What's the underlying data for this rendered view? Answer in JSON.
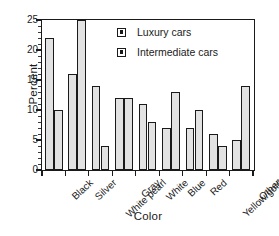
{
  "chart_data": {
    "type": "bar",
    "title": "",
    "xlabel": "Color",
    "ylabel": "Percent",
    "categories": [
      "Black",
      "Silver",
      "White pearl",
      "Gray",
      "White",
      "Blue",
      "Red",
      "Yellow/gold",
      "Other"
    ],
    "series": [
      {
        "name": "Luxury cars",
        "values": [
          22,
          16,
          14,
          12,
          11,
          7,
          7,
          6,
          5
        ]
      },
      {
        "name": "Intermediate cars",
        "values": [
          10,
          25,
          4,
          12,
          8,
          13,
          10,
          4,
          14
        ]
      }
    ],
    "ylim": [
      0,
      25
    ],
    "ytick_labels": [
      "0",
      "5",
      "10",
      "15",
      "20",
      "25"
    ],
    "ytick_values": [
      0,
      5,
      10,
      15,
      20,
      25
    ],
    "yminor_step": 1,
    "grid": false,
    "legend_position": "top-right-inside",
    "bar_fill_color": "#e2e2e2",
    "bar_edge_color": "#1a1a1a",
    "axis_color": "#1a1a1a",
    "background_color": "#ffffff"
  }
}
